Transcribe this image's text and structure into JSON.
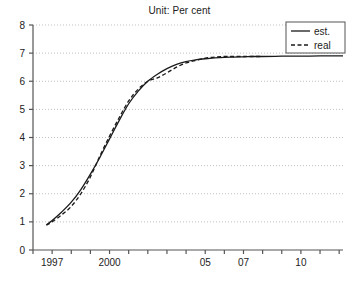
{
  "chart_data": {
    "type": "line",
    "title": "Unit: Per cent",
    "xlabel": "",
    "ylabel": "",
    "ylim": [
      0,
      8
    ],
    "xlim": [
      1996,
      2012.2
    ],
    "grid": "horizontal-dotted",
    "legend_position": "top-right",
    "yticks": [
      "0",
      "1",
      "2",
      "3",
      "4",
      "5",
      "6",
      "7",
      "8"
    ],
    "ytick_values": [
      0,
      1,
      2,
      3,
      4,
      5,
      6,
      7,
      8
    ],
    "xtick_values": [
      1996,
      1997,
      1998,
      1999,
      2000,
      2001,
      2002,
      2003,
      2004,
      2005,
      2006,
      2007,
      2008,
      2009,
      2010,
      2011,
      2012
    ],
    "xtick_labels": [
      "",
      "1997",
      "",
      "",
      "2000",
      "",
      "",
      "",
      "",
      "05",
      "",
      "07",
      "",
      "",
      "10",
      "",
      ""
    ],
    "series": [
      {
        "name": "est.",
        "style": "solid",
        "color": "#1a1a1a",
        "x": [
          1996.7,
          1997.0,
          1997.5,
          1998.0,
          1998.5,
          1999.0,
          1999.5,
          2000.0,
          2000.5,
          2001.0,
          2001.5,
          2002.0,
          2002.5,
          2003.0,
          2003.5,
          2004.0,
          2004.5,
          2005.0,
          2005.5,
          2006.0,
          2006.5,
          2007.0,
          2007.5,
          2008.0,
          2009.0,
          2010.0,
          2011.0,
          2012.2
        ],
        "values": [
          0.9,
          1.05,
          1.35,
          1.7,
          2.15,
          2.7,
          3.3,
          3.95,
          4.6,
          5.2,
          5.65,
          6.0,
          6.25,
          6.45,
          6.6,
          6.7,
          6.76,
          6.8,
          6.83,
          6.85,
          6.86,
          6.87,
          6.88,
          6.88,
          6.89,
          6.89,
          6.9,
          6.9
        ]
      },
      {
        "name": "real",
        "style": "dashed",
        "color": "#1a1a1a",
        "x": [
          1996.7,
          1997.0,
          1997.5,
          1998.0,
          1998.5,
          1999.0,
          1999.5,
          2000.0,
          2000.5,
          2001.0,
          2001.5,
          2002.0,
          2002.5,
          2003.0,
          2003.5,
          2004.0,
          2004.5,
          2005.0,
          2005.5,
          2006.0,
          2006.5,
          2007.0,
          2007.5,
          2008.0
        ],
        "values": [
          0.88,
          1.0,
          1.25,
          1.55,
          2.0,
          2.6,
          3.35,
          4.05,
          4.7,
          5.3,
          5.72,
          6.0,
          6.12,
          6.3,
          6.5,
          6.65,
          6.74,
          6.82,
          6.86,
          6.88,
          6.88,
          6.88,
          6.88,
          6.88
        ]
      }
    ]
  },
  "legend": {
    "items": [
      {
        "label": "est.",
        "style": "solid"
      },
      {
        "label": "real",
        "style": "dashed"
      }
    ]
  }
}
